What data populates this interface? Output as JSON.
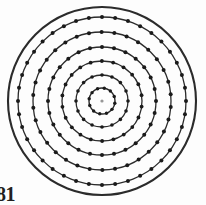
{
  "figure": {
    "caption": "81",
    "background_color": "#fdfdfd",
    "line_color": "#2b2b2b",
    "marker_color": "#1a1a1a",
    "center": {
      "x": 102,
      "y": 101
    },
    "width": 206,
    "height": 205
  },
  "chart_data": {
    "type": "scatter",
    "title": "",
    "subtitle": "",
    "xlabel": "",
    "ylabel": "",
    "legend": [],
    "grid": false,
    "coordinate_system": "polar",
    "center": {
      "x": 102,
      "y": 101
    },
    "xlim": [
      8,
      196
    ],
    "ylim": [
      7,
      195
    ],
    "boundary": {
      "name": "outer-boundary-circle",
      "radius": 94,
      "has_markers": false,
      "stroke_width": 2.1
    },
    "series": [
      {
        "name": "ring-1",
        "radius": 84,
        "marker_count": 40,
        "marker_size": 2.0,
        "stroke_width": 1.3,
        "angle_offset_deg": 0
      },
      {
        "name": "ring-2",
        "radius": 69,
        "marker_count": 34,
        "marker_size": 2.0,
        "stroke_width": 1.3,
        "angle_offset_deg": 5
      },
      {
        "name": "ring-3",
        "radius": 54,
        "marker_count": 28,
        "marker_size": 2.0,
        "stroke_width": 1.3,
        "angle_offset_deg": 0
      },
      {
        "name": "ring-4",
        "radius": 40,
        "marker_count": 22,
        "marker_size": 1.9,
        "stroke_width": 1.3,
        "angle_offset_deg": 8
      },
      {
        "name": "ring-5",
        "radius": 26,
        "marker_count": 16,
        "marker_size": 1.8,
        "stroke_width": 1.3,
        "angle_offset_deg": 0
      },
      {
        "name": "ring-6",
        "radius": 13,
        "marker_count": 12,
        "marker_size": 1.7,
        "stroke_width": 1.4,
        "angle_offset_deg": 10
      }
    ],
    "center_point": {
      "name": "center-node",
      "radius": 0,
      "marker_size": 1.6,
      "opacity": 0.45
    }
  }
}
